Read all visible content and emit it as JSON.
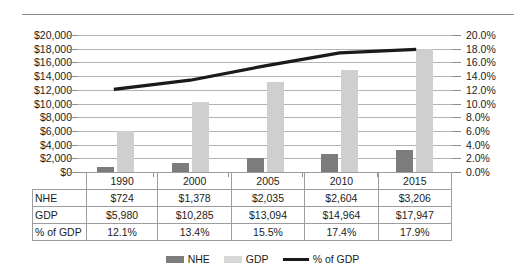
{
  "chart_data": {
    "type": "bar",
    "title": "",
    "subtitle": "",
    "xlabel": "",
    "ylabel": "",
    "grid": true,
    "legend_position": "bottom",
    "categories": [
      "1990",
      "2000",
      "2005",
      "2010",
      "2015"
    ],
    "axes": {
      "left": {
        "label": "",
        "min": 0,
        "max": 20000,
        "step": 2000,
        "tick_labels": [
          "$0",
          "$2,000",
          "$4,000",
          "$6,000",
          "$8,000",
          "$10,000",
          "$12,000",
          "$14,000",
          "$16,000",
          "$18,000",
          "$20,000"
        ],
        "tick_values": [
          0,
          2000,
          4000,
          6000,
          8000,
          10000,
          12000,
          14000,
          16000,
          18000,
          20000
        ]
      },
      "right": {
        "label": "",
        "min": 0,
        "max": 20,
        "step": 2,
        "tick_labels": [
          "0.0%",
          "2.0%",
          "4.0%",
          "6.0%",
          "8.0%",
          "10.0%",
          "12.0%",
          "14.0%",
          "16.0%",
          "18.0%",
          "20.0%"
        ],
        "tick_values": [
          0,
          2,
          4,
          6,
          8,
          10,
          12,
          14,
          16,
          18,
          20
        ]
      }
    },
    "series": [
      {
        "name": "NHE",
        "type": "bar",
        "axis": "left",
        "color": "#7c7c7c",
        "values": [
          724,
          1378,
          2035,
          2604,
          3206
        ],
        "labels": [
          "$724",
          "$1,378",
          "$2,035",
          "$2,604",
          "$3,206"
        ]
      },
      {
        "name": "GDP",
        "type": "bar",
        "axis": "left",
        "color": "#cfcfcf",
        "values": [
          5980,
          10285,
          13094,
          14964,
          17947
        ],
        "labels": [
          "$5,980",
          "$10,285",
          "$13,094",
          "$14,964",
          "$17,947"
        ]
      },
      {
        "name": "% of GDP",
        "type": "line",
        "axis": "right",
        "color": "#1a1a1a",
        "values": [
          12.1,
          13.4,
          15.5,
          17.4,
          17.9
        ],
        "labels": [
          "12.1%",
          "13.4%",
          "15.5%",
          "17.4%",
          "17.9%"
        ]
      }
    ]
  },
  "table": {
    "corner_label": "",
    "column_headers": [
      "1990",
      "2000",
      "2005",
      "2010",
      "2015"
    ],
    "rows": [
      {
        "label": "NHE",
        "cells": [
          "$724",
          "$1,378",
          "$2,035",
          "$2,604",
          "$3,206"
        ]
      },
      {
        "label": "GDP",
        "cells": [
          "$5,980",
          "$10,285",
          "$13,094",
          "$14,964",
          "$17,947"
        ]
      },
      {
        "label": "% of GDP",
        "cells": [
          "12.1%",
          "13.4%",
          "15.5%",
          "17.4%",
          "17.9%"
        ]
      }
    ]
  },
  "legend": {
    "items": [
      {
        "label": "NHE",
        "marker": "square-dark",
        "color": "#7c7c7c"
      },
      {
        "label": "GDP",
        "marker": "square-light",
        "color": "#d8d8d8"
      },
      {
        "label": "% of GDP",
        "marker": "line-black",
        "color": "#1a1a1a"
      }
    ]
  }
}
